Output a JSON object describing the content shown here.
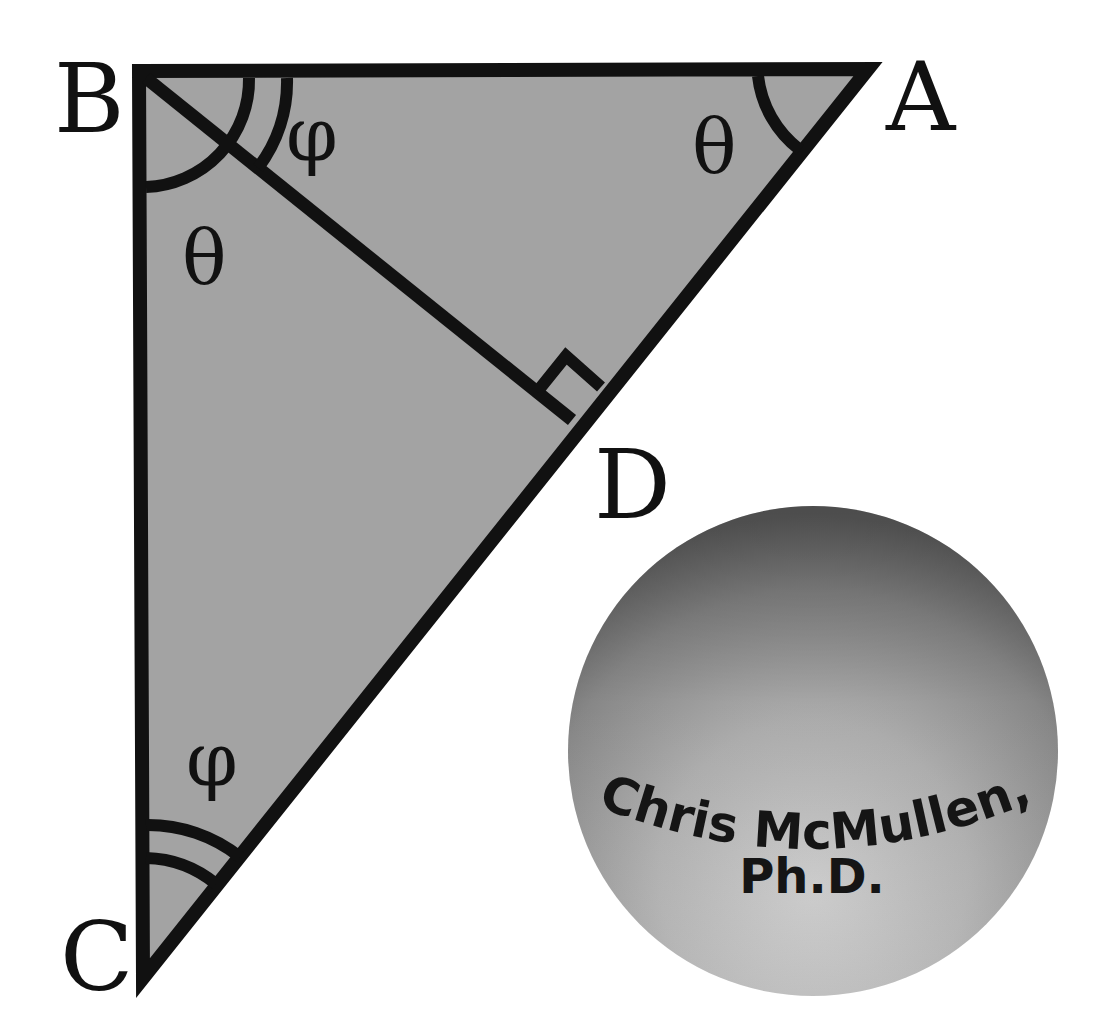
{
  "diagram": {
    "colors": {
      "background": "#ffffff",
      "triangle_fill": "#a3a3a3",
      "stroke": "#111111",
      "sphere_light": "#c9c9c9",
      "sphere_dark": "#6f6f6f"
    },
    "vertices": {
      "A": {
        "label": "A",
        "x": 882,
        "y": 62
      },
      "B": {
        "label": "B",
        "x": 132,
        "y": 64
      },
      "C": {
        "label": "C",
        "x": 138,
        "y": 992
      },
      "D": {
        "label": "D",
        "x": 570,
        "y": 420
      }
    },
    "segments": [
      {
        "from": "B",
        "to": "A"
      },
      {
        "from": "A",
        "to": "C"
      },
      {
        "from": "C",
        "to": "B"
      },
      {
        "from": "B",
        "to": "D"
      }
    ],
    "angle_labels": {
      "B_upper": {
        "symbol": "φ",
        "arcs": 2,
        "note": "angle ABD"
      },
      "A": {
        "symbol": "θ",
        "arcs": 1,
        "note": "angle BAD"
      },
      "B_lower": {
        "symbol": "θ",
        "arcs": 1,
        "note": "angle DBC"
      },
      "C": {
        "symbol": "φ",
        "arcs": 2,
        "note": "angle BCD"
      }
    },
    "right_angle_marker": {
      "at": "D",
      "note": "BD perpendicular to AC"
    }
  },
  "logo": {
    "line1": "Chris McMullen,",
    "line2": "Ph.D."
  }
}
